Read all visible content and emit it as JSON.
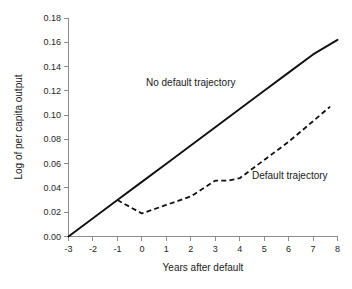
{
  "chart_data": {
    "type": "line",
    "title": "",
    "xlabel": "Years after default",
    "ylabel": "Log of per capita output",
    "xlim": [
      -3,
      8
    ],
    "ylim": [
      0.0,
      0.18
    ],
    "grid": false,
    "legend_position": "inline-annotations",
    "xticks": [
      "-3",
      "-2",
      "-1",
      "0",
      "1",
      "2",
      "3",
      "4",
      "5",
      "6",
      "7",
      "8"
    ],
    "xtick_values": [
      -3,
      -2,
      -1,
      0,
      1,
      2,
      3,
      4,
      5,
      6,
      7,
      8
    ],
    "yticks": [
      "0.00",
      "0.02",
      "0.04",
      "0.06",
      "0.08",
      "0.10",
      "0.12",
      "0.14",
      "0.16",
      "0.18"
    ],
    "ytick_values": [
      0.0,
      0.02,
      0.04,
      0.06,
      0.08,
      0.1,
      0.12,
      0.14,
      0.16,
      0.18
    ],
    "series": [
      {
        "name": "No default trajectory",
        "style": "solid",
        "color": "#111111",
        "x": [
          -3,
          -2,
          -1,
          0,
          1,
          2,
          3,
          4,
          5,
          6,
          7,
          8
        ],
        "values": [
          0.0,
          0.015,
          0.03,
          0.045,
          0.06,
          0.075,
          0.09,
          0.105,
          0.12,
          0.135,
          0.15,
          0.162
        ]
      },
      {
        "name": "Default trajectory",
        "style": "dashed",
        "color": "#111111",
        "x": [
          -1,
          0,
          1,
          2,
          3,
          3.5,
          4,
          5,
          6,
          7,
          7.7
        ],
        "values": [
          0.03,
          0.019,
          0.026,
          0.033,
          0.046,
          0.046,
          0.048,
          0.063,
          0.078,
          0.095,
          0.107
        ]
      }
    ],
    "annotations": [
      {
        "text": "No default trajectory",
        "x": 1.2,
        "y": 0.122
      },
      {
        "text": "Default trajectory",
        "x": 5.3,
        "y": 0.058
      }
    ]
  }
}
